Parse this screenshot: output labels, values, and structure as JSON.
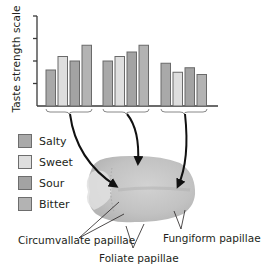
{
  "figure": {
    "y_axis_label": "Taste strength scale",
    "legend": [
      {
        "label": "Salty",
        "color": "#a9a9a9"
      },
      {
        "label": "Sweet",
        "color": "#dedede"
      },
      {
        "label": "Sour",
        "color": "#a3a3a3"
      },
      {
        "label": "Bitter",
        "color": "#b3b3b3"
      }
    ],
    "callouts": {
      "circumvallate": "Circumvallate papillae",
      "foliate": "Foliate papillae",
      "fungiform": "Fungiform papillae"
    }
  },
  "chart_data": {
    "type": "bar",
    "title": "",
    "xlabel": "",
    "ylabel": "Taste strength scale",
    "ylim": [
      0,
      4
    ],
    "y_ticks": [
      0,
      1,
      2,
      3,
      4
    ],
    "y_tick_labels_shown": false,
    "grid": false,
    "legend_position": "left, below chart",
    "categories": [
      "Circumvallate papillae",
      "Foliate papillae",
      "Fungiform papillae"
    ],
    "series": [
      {
        "name": "Salty",
        "values": [
          1.6,
          2.0,
          1.9
        ]
      },
      {
        "name": "Sweet",
        "values": [
          2.2,
          2.2,
          1.5
        ]
      },
      {
        "name": "Sour",
        "values": [
          2.0,
          2.4,
          1.7
        ]
      },
      {
        "name": "Bitter",
        "values": [
          2.7,
          2.7,
          1.4
        ]
      }
    ]
  }
}
